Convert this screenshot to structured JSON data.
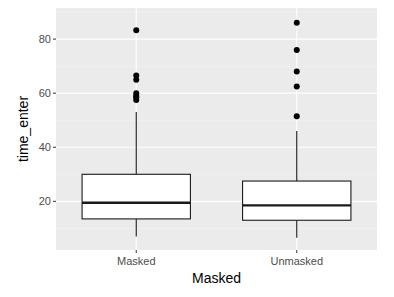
{
  "chart_data": {
    "type": "boxplot",
    "title": "",
    "xlabel": "Masked",
    "ylabel": "time_enter",
    "categories": [
      "Masked",
      "Unmasked"
    ],
    "ylim": [
      2,
      91.5
    ],
    "yticks": [
      20,
      40,
      60,
      80
    ],
    "grid": true,
    "legend": null,
    "series": [
      {
        "name": "Masked",
        "whisker_low": 7,
        "q1": 13.5,
        "median": 19.5,
        "q3": 30,
        "whisker_high": 53,
        "outliers": [
          83.3,
          66.5,
          65,
          60,
          59,
          58.5,
          57.5
        ]
      },
      {
        "name": "Unmasked",
        "whisker_low": 6.5,
        "q1": 13,
        "median": 18.5,
        "q3": 27.5,
        "whisker_high": 46,
        "outliers": [
          86,
          76,
          68,
          62.5,
          51.5
        ]
      }
    ]
  },
  "colors": {
    "panel_background": "#ebebeb",
    "grid_major": "#ffffff",
    "grid_minor": "#f5f5f5",
    "box_fill": "#ffffff",
    "box_line": "#1a1a1a",
    "point": "#000000",
    "tick_text": "#4d4d4d"
  }
}
